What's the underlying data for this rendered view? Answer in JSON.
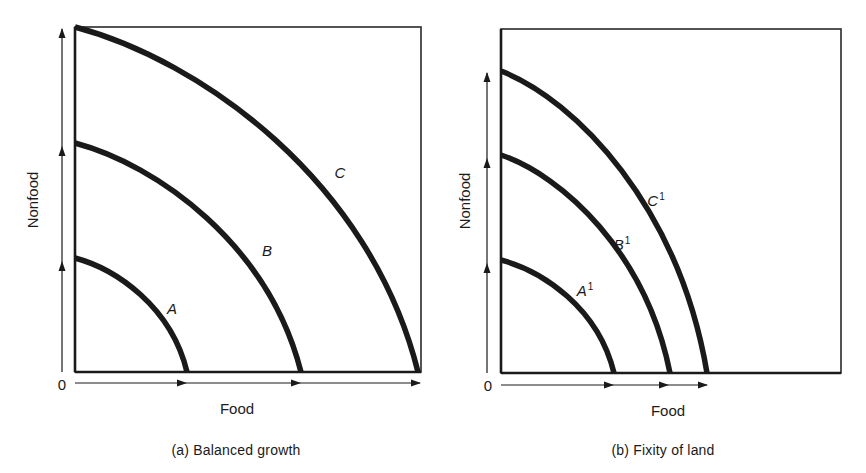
{
  "figure": {
    "panels": [
      {
        "id": "a",
        "caption": "(a)  Balanced growth",
        "x_axis_label": "Food",
        "y_axis_label": "Nonfood",
        "origin_label": "0",
        "frame": {
          "left": 75,
          "top": 27,
          "right": 421,
          "bottom": 372
        },
        "curves": [
          {
            "name": "A",
            "superscript": "",
            "x_intercept": 187,
            "y_intercept": 258
          },
          {
            "name": "B",
            "superscript": "",
            "x_intercept": 301,
            "y_intercept": 143
          },
          {
            "name": "C",
            "superscript": "",
            "x_intercept": 418,
            "y_intercept": 27
          }
        ],
        "y_arrows": [
          260,
          145,
          27
        ],
        "x_arrows": [
          186,
          300,
          420
        ]
      },
      {
        "id": "b",
        "caption": "(b)  Fixity of land",
        "x_axis_label": "Food",
        "y_axis_label": "Nonfood",
        "origin_label": "0",
        "frame": {
          "left": 501,
          "top": 29,
          "right": 841,
          "bottom": 373
        },
        "curves": [
          {
            "name": "A",
            "superscript": "1",
            "x_intercept": 614,
            "y_intercept": 260
          },
          {
            "name": "B",
            "superscript": "1",
            "x_intercept": 670,
            "y_intercept": 155
          },
          {
            "name": "C",
            "superscript": "1",
            "x_intercept": 707,
            "y_intercept": 71
          }
        ],
        "y_arrows": [
          262,
          157,
          73
        ],
        "x_arrows": [
          613,
          668,
          707
        ]
      }
    ],
    "colors": {
      "ink": "#1a1a1a",
      "frame": "#2a2a2a",
      "background": "#ffffff"
    }
  },
  "labels": {
    "a": {
      "caption": "(a)  Balanced growth",
      "x": "Food",
      "y": "Nonfood",
      "origin": "0",
      "curve_A": "A",
      "curve_B": "B",
      "curve_C": "C"
    },
    "b": {
      "caption": "(b)  Fixity of land",
      "x": "Food",
      "y": "Nonfood",
      "origin": "0",
      "curve_A": "A",
      "curve_B": "B",
      "curve_C": "C",
      "sup": "1"
    }
  }
}
